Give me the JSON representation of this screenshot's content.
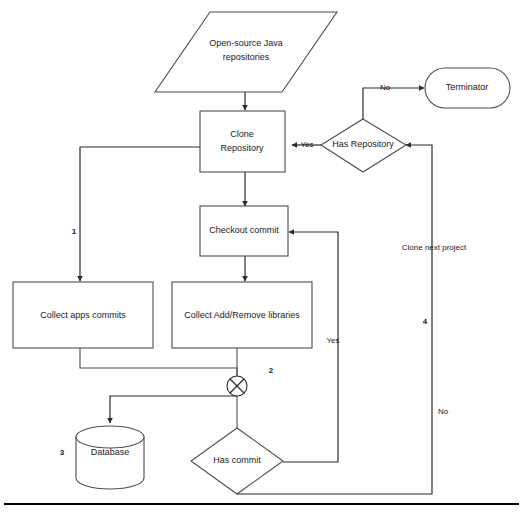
{
  "diagram": {
    "colors": {
      "background": "#ffffff",
      "stroke": "#4d4d4d",
      "stroke_dark": "#2b2b2b",
      "text": "#1a1a1a"
    },
    "nodes": [
      {
        "id": "input",
        "shape": "parallelogram",
        "label_line1": "Open-source Java",
        "label_line2": "repositories"
      },
      {
        "id": "clone",
        "shape": "process",
        "label_line1": "Clone",
        "label_line2": "Repository"
      },
      {
        "id": "checkout",
        "shape": "process",
        "label": "Checkout commit"
      },
      {
        "id": "apps",
        "shape": "process",
        "label": "Collect apps commits"
      },
      {
        "id": "libs",
        "shape": "process",
        "label": "Collect Add/Remove libraries"
      },
      {
        "id": "junction",
        "shape": "crossed-circle",
        "label": ""
      },
      {
        "id": "database",
        "shape": "cylinder",
        "label": "Database"
      },
      {
        "id": "hascommit",
        "shape": "decision",
        "label": "Has commit"
      },
      {
        "id": "hasrepo",
        "shape": "decision",
        "label": "Has Repository"
      },
      {
        "id": "terminator",
        "shape": "rounded",
        "label": "Terminator"
      }
    ],
    "edge_labels": [
      {
        "id": "yes-repo",
        "text": "Yes"
      },
      {
        "id": "no-repo",
        "text": "No"
      },
      {
        "id": "yes-commit",
        "text": "Yes"
      },
      {
        "id": "no-commit",
        "text": "No"
      },
      {
        "id": "clone-next",
        "text": "Clone next project"
      }
    ],
    "step_numbers": [
      {
        "id": "step-1",
        "text": "1"
      },
      {
        "id": "step-2",
        "text": "2"
      },
      {
        "id": "step-3",
        "text": "3"
      },
      {
        "id": "step-4",
        "text": "4"
      }
    ]
  }
}
